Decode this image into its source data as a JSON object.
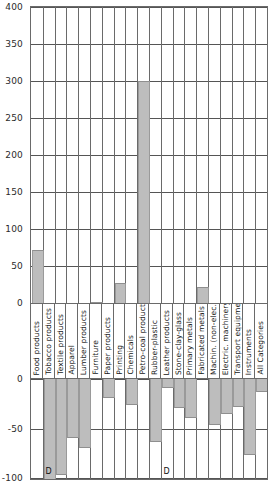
{
  "chart_data": {
    "type": "bar",
    "title": "",
    "subtitle": "",
    "xlabel": "",
    "ylabel": "",
    "grid": true,
    "legend": null,
    "broken_axis": true,
    "panels": [
      {
        "name": "upper",
        "ylim": [
          0,
          400
        ],
        "yticks": [
          0,
          50,
          100,
          150,
          200,
          250,
          300,
          350,
          400
        ],
        "ytick_labels": [
          "0",
          "50",
          "100",
          "150",
          "200",
          "250",
          "300",
          "350",
          "400"
        ]
      },
      {
        "name": "lower",
        "ylim": [
          -100,
          0
        ],
        "yticks": [
          -100,
          -50,
          0
        ],
        "ytick_labels": [
          "-100",
          "-50",
          "0"
        ]
      }
    ],
    "categories": [
      "Food products",
      "Tobacco products",
      "Textile products",
      "Apparel",
      "Lumber products",
      "Furniture",
      "Paper products",
      "Printing",
      "Chemicals",
      "Petro-coal products",
      "Rubber-plastic",
      "Leather products",
      "Stone-clay-glass",
      "Primary metals",
      "Fabricated metals",
      "Machin. (non-elec.)",
      "Electric. machinery",
      "Transport equipment",
      "Instruments",
      "All Categories"
    ],
    "values_positive": [
      72,
      0,
      0,
      0,
      0,
      2,
      0,
      27,
      0,
      300,
      0,
      0,
      0,
      0,
      22,
      0,
      0,
      0,
      0,
      0
    ],
    "values_negative": [
      0,
      -100,
      -95,
      -58,
      -68,
      0,
      -18,
      0,
      -25,
      0,
      -62,
      -8,
      -28,
      -38,
      0,
      -45,
      -34,
      -27,
      -75,
      -12
    ],
    "annotations": [
      {
        "category": "Tobacco products",
        "label": "D",
        "panel": "lower"
      },
      {
        "category": "Leather products",
        "label": "D",
        "panel": "lower"
      }
    ],
    "bar_color": "#bdbdbd",
    "axis_color": "#6a6a6a",
    "grid_color": "#555555"
  }
}
